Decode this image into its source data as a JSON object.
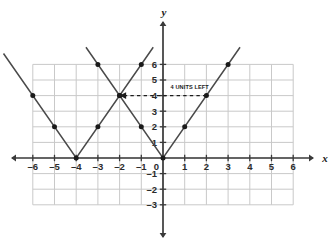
{
  "figure": {
    "background_color": "#ffffff",
    "grid_color": "#c9c9c9",
    "axis_color": "#3a3a3a",
    "curve_color": "#4a4a4a",
    "point_color": "#1a1a1a",
    "x_axis_name": "x",
    "y_axis_name": "y"
  },
  "annotation": {
    "label": "4 UNITS LEFT",
    "from_point": [
      2,
      4
    ],
    "to_point": [
      -2,
      4
    ],
    "arrow_direction": "left",
    "style": "dashed"
  },
  "axis": {
    "x_ticks": [
      "-6",
      "-5",
      "-4",
      "-3",
      "-2",
      "-1",
      "0",
      "1",
      "2",
      "3",
      "4",
      "5",
      "6"
    ],
    "y_ticks": [
      "6",
      "5",
      "4",
      "3",
      "2",
      "1",
      "-1",
      "-2",
      "-3"
    ],
    "origin_label": "0"
  },
  "chart_data": {
    "type": "line",
    "title": "",
    "xlabel": "x",
    "ylabel": "y",
    "xlim": [
      -6,
      6
    ],
    "ylim": [
      -3,
      6
    ],
    "grid": true,
    "legend": false,
    "x_ticks": [
      -6,
      -5,
      -4,
      -3,
      -2,
      -1,
      0,
      1,
      2,
      3,
      4,
      5,
      6
    ],
    "y_ticks": [
      -3,
      -2,
      -1,
      1,
      2,
      3,
      4,
      5,
      6
    ],
    "series": [
      {
        "name": "y = 2|x|",
        "vertex": [
          0,
          0
        ],
        "slope": 2,
        "points": [
          [
            -3,
            6
          ],
          [
            -2,
            4
          ],
          [
            -1,
            2
          ],
          [
            0,
            0
          ],
          [
            1,
            2
          ],
          [
            2,
            4
          ],
          [
            3,
            6
          ]
        ],
        "drawn_path": [
          [
            -3.55,
            7.1
          ],
          [
            0,
            0
          ],
          [
            3.55,
            7.1
          ]
        ]
      },
      {
        "name": "y = 2|x + 4|",
        "vertex": [
          -4,
          0
        ],
        "slope": 2,
        "points": [
          [
            -7,
            6
          ],
          [
            -6,
            4
          ],
          [
            -5,
            2
          ],
          [
            -4,
            0
          ],
          [
            -3,
            2
          ],
          [
            -2,
            4
          ],
          [
            -1,
            6
          ]
        ],
        "drawn_path": [
          [
            -7.35,
            6.7
          ],
          [
            -4,
            0
          ],
          [
            -0.45,
            7.1
          ]
        ]
      }
    ],
    "annotations": [
      {
        "text": "4 UNITS LEFT",
        "x": 0.35,
        "y": 4.45,
        "arrow_from": [
          2,
          4
        ],
        "arrow_to": [
          -2,
          4
        ]
      }
    ]
  }
}
